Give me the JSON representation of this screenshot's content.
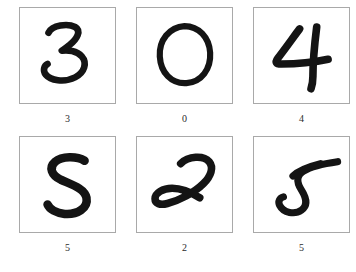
{
  "figure": {
    "type": "image-grid",
    "background_color": "#ffffff",
    "rows": 2,
    "columns": 3,
    "border_color": "#a9a9a9",
    "ink_color": "#141414",
    "caption_color": "#2b2b2b"
  },
  "samples": [
    {
      "index": 0,
      "label": "3",
      "image_name": "handwritten-digit-3",
      "row": 1,
      "column": 1
    },
    {
      "index": 1,
      "label": "0",
      "image_name": "handwritten-digit-0",
      "row": 1,
      "column": 2
    },
    {
      "index": 2,
      "label": "4",
      "image_name": "handwritten-digit-4",
      "row": 1,
      "column": 3
    },
    {
      "index": 3,
      "label": "5",
      "image_name": "handwritten-digit-5",
      "row": 2,
      "column": 1
    },
    {
      "index": 4,
      "label": "2",
      "image_name": "handwritten-digit-2",
      "row": 2,
      "column": 2
    },
    {
      "index": 5,
      "label": "5",
      "image_name": "handwritten-digit-5-alt",
      "row": 2,
      "column": 3
    }
  ]
}
